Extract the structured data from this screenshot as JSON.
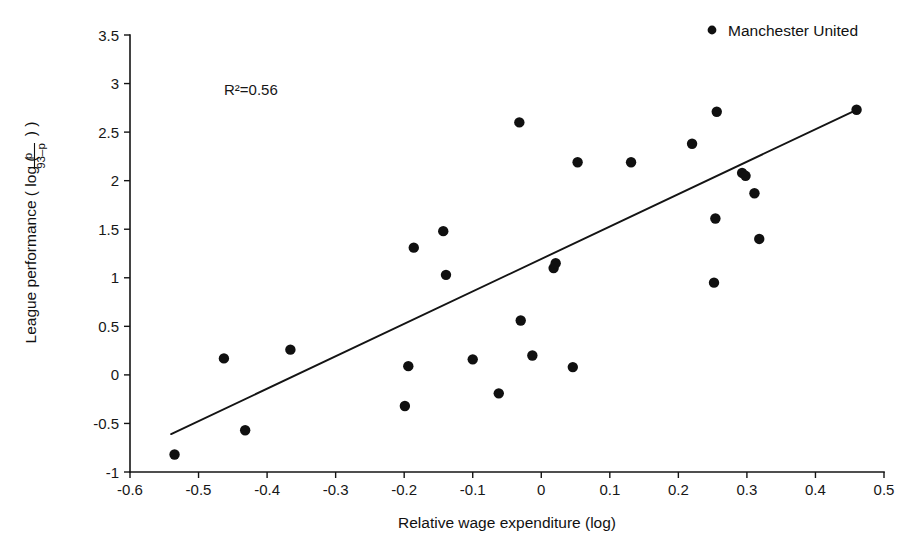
{
  "chart_data": {
    "type": "scatter",
    "title": "",
    "xlabel": "Relative wage expenditure (log)",
    "ylabel": "League performance ( log ( p / (93-p) ) )",
    "ylabel_parts": {
      "prefix": "League performance ( log (",
      "numerator": "p",
      "denominator": "93–p",
      "suffix": ") )"
    },
    "xlim": [
      -0.6,
      0.5
    ],
    "ylim": [
      -1,
      3.5
    ],
    "xticks": [
      -0.6,
      -0.5,
      -0.4,
      -0.3,
      -0.2,
      -0.1,
      0,
      0.1,
      0.2,
      0.3,
      0.4,
      0.5
    ],
    "xticklabels": [
      "-0.6",
      "-0.5",
      "-0.4",
      "-0.3",
      "-0.2",
      "-0.1",
      "0",
      "0.1",
      "0.2",
      "0.3",
      "0.4",
      "0.5"
    ],
    "yticks": [
      -1,
      -0.5,
      0,
      0.5,
      1,
      1.5,
      2,
      2.5,
      3,
      3.5
    ],
    "yticklabels": [
      "-1",
      "-0.5",
      "0",
      "0.5",
      "1",
      "1.5",
      "2",
      "2.5",
      "3",
      "3.5"
    ],
    "grid": false,
    "annotation": "R²=0.56",
    "annotation_value": 0.56,
    "legend": {
      "position": "top-right",
      "entries": [
        {
          "marker": "filled-circle",
          "label": "Manchester United"
        }
      ]
    },
    "marker": {
      "shape": "filled-circle",
      "color": "#101010",
      "size_px": 5.2
    },
    "trendline": {
      "type": "linear",
      "color": "#141414",
      "x_start": -0.54,
      "y_start": -0.61,
      "x_end": 0.46,
      "y_end": 2.73
    },
    "points": [
      {
        "x": -0.535,
        "y": -0.82
      },
      {
        "x": -0.463,
        "y": 0.17
      },
      {
        "x": -0.432,
        "y": -0.57
      },
      {
        "x": -0.366,
        "y": 0.26
      },
      {
        "x": -0.199,
        "y": -0.32
      },
      {
        "x": -0.194,
        "y": 0.09
      },
      {
        "x": -0.186,
        "y": 1.31
      },
      {
        "x": -0.143,
        "y": 1.48
      },
      {
        "x": -0.139,
        "y": 1.03
      },
      {
        "x": -0.1,
        "y": 0.16
      },
      {
        "x": -0.062,
        "y": -0.19
      },
      {
        "x": -0.032,
        "y": 2.6
      },
      {
        "x": -0.03,
        "y": 0.56
      },
      {
        "x": -0.013,
        "y": 0.2
      },
      {
        "x": 0.018,
        "y": 1.1
      },
      {
        "x": 0.021,
        "y": 1.15
      },
      {
        "x": 0.046,
        "y": 0.08
      },
      {
        "x": 0.053,
        "y": 2.19
      },
      {
        "x": 0.131,
        "y": 2.19
      },
      {
        "x": 0.22,
        "y": 2.38
      },
      {
        "x": 0.252,
        "y": 0.95
      },
      {
        "x": 0.254,
        "y": 1.61
      },
      {
        "x": 0.256,
        "y": 2.71
      },
      {
        "x": 0.293,
        "y": 2.08
      },
      {
        "x": 0.298,
        "y": 2.05
      },
      {
        "x": 0.311,
        "y": 1.87
      },
      {
        "x": 0.318,
        "y": 1.4
      },
      {
        "x": 0.46,
        "y": 2.73
      }
    ],
    "highlight_point": {
      "x": 0.256,
      "y": 2.71,
      "label": "Manchester United"
    }
  },
  "legend_marker_glyph": "●"
}
